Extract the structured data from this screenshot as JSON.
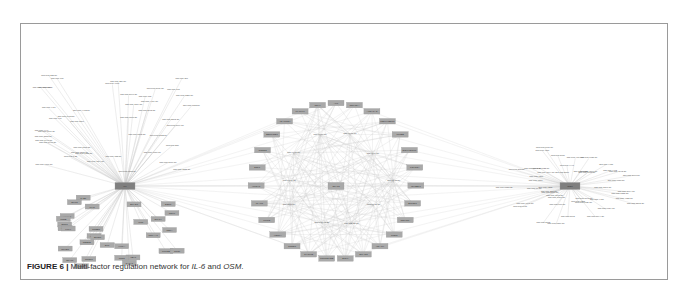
{
  "figure": {
    "label": "FIGURE 6",
    "separator": " | ",
    "caption_prefix": "Multi-factor regulation network for ",
    "gene1": "IL-6",
    "caption_mid": " and ",
    "gene2": "OSM",
    "caption_suffix": "."
  },
  "network": {
    "hubs": [
      {
        "id": "IL6",
        "label": "IL6",
        "x": 125,
        "y": 186
      },
      {
        "id": "STAT3",
        "label": "STAT3",
        "x": 336,
        "y": 186
      },
      {
        "id": "OSM",
        "label": "OSM",
        "x": 570,
        "y": 186
      }
    ],
    "colors": {
      "gene_node": "#a9a9a9",
      "hub_node": "#7f7f7f",
      "edge": "#c8c8c8",
      "mirna_text": "#555555"
    },
    "il6_mirnas": [
      "hsa-miR-23b-5p",
      "hsa-miR-217",
      "hsa-miR-608",
      "hsa-miR-330-5p",
      "hsa-miR-4668",
      "hsa-miR-4518-5p",
      "hsa-miR-1323",
      "hsa-miR-5010-3p",
      "hsa-miR-765",
      "hsa-miR-125b-5p",
      "hsa-miR-5696-5p",
      "hsa-miR-613",
      "hsa-miR-4459-5p",
      "hsa-miR-6852-5p",
      "hsa-miR-6854-5p",
      "hsa-miR-4483-5p",
      "hsa-miR-4434",
      "hsa-miR-3663-5p",
      "hsa-miR-1913-5p",
      "hsa-miR-495",
      "hsa-miR-6508-5p",
      "hsa-miR-3202-3p",
      "hsa-miR-1307",
      "hsa-miR-5004-5p",
      "hsa-miR-6870-5p",
      "hsa-miR-4449",
      "hsa-miR-5722-5p",
      "hsa-miR-6502-3p",
      "hsa-miR-3183-5p",
      "hsa-miR-6740-5p",
      "hsa-miR-1908-5p",
      "hsa-miR-6515-5p",
      "hsa-miR-338",
      "hsa-miR-1285-5p",
      "hsa-miR-6088-5p",
      "hsa-miR-6133-5p",
      "hsa-miR-1-3p",
      "hsa-miR-153-5p",
      "hsa-miR-4504-5p",
      "hsa-miR-3176-5p",
      "hsa-miR-4787-5p",
      "hsa-miR-1322-3p",
      "hsa-miR-6855-5p"
    ],
    "il6_genes": [
      "TAB1",
      "SLIT3",
      "SMAD1",
      "ESR1",
      "MYC",
      "CDK6",
      "FOSL1",
      "JUNB",
      "STAT4",
      "IL6R",
      "EGR1",
      "SOCS3",
      "KLF4",
      "CREB1",
      "RELA",
      "CEBPB",
      "PRKAA1",
      "EP300",
      "CEBPD",
      "HIF1A",
      "SP1",
      "PTGS2",
      "NFKB1",
      "CTCF",
      "YBX1",
      "NR3C1",
      "TP53",
      "STAT1",
      "GATA1",
      "IRF1"
    ],
    "central_genes": [
      "AKT",
      "CDKN1A",
      "ALDH1A2",
      "MELK/TBP11",
      "PLCB2",
      "SOX9/SIRT1",
      "FOXO3A",
      "IGF2BP1",
      "BCL2L1",
      "CDKN2A",
      "PTEN",
      "HDAC4",
      "SMAD3",
      "BCL6",
      "TNFRSF11B",
      "CXCL12",
      "CCND1",
      "VEGFA",
      "MMP2",
      "ICAM1",
      "HMOX1",
      "E2F1",
      "CCND2",
      "SERPINE1",
      "ADAMTS4",
      "MAPK14",
      "CD44"
    ],
    "central_mirnas": [
      "hsa-let-7b-5p",
      "hsa-let-7a-5p",
      "hsa-miR-25-5p",
      "hsa-miR-93-5p",
      "hsa-let-7f-5p",
      "hsa-let-7e-5p",
      "hsa-let-7c-5p",
      "hsa-let-7d-5p",
      "hsa-let-7g-5p",
      "hsa-let-7i-5p"
    ],
    "osm_mirnas": [
      "hsa-miR-1322-3p",
      "hsa-miR-3064-5p",
      "hsa-miR-4632-5p",
      "hsa-miR-3202-3p",
      "hsa-miR-6734-5p",
      "hsa-miR-4428",
      "hsa-miR-5095-3p",
      "hsa-miR-5194-3p",
      "hsa-miR-6820-5p",
      "hsa-miR-1265",
      "hsa-miR-5703",
      "hsa-miR-6510-5p",
      "hsa-miR-876-5p",
      "hsa-miR-3182",
      "hsa-miR-6087-5p",
      "hsa-miR-6811-5p",
      "hsa-miR-1908",
      "hsa-miR-4691-5p",
      "hsa-miR-6876-5p",
      "hsa-miR-373-5p",
      "hsa-miR-4253",
      "hsa-miR-17-5p",
      "hsa-miR-6758-5p",
      "hsa-miR-4518",
      "hsa-miR-372-3p",
      "hsa-miR-4286",
      "hsa-miR-6794-5p",
      "hsa-miR-1343-3p",
      "hsa-miR-6822-5p",
      "hsa-miR-4516",
      "hsa-miR-3157",
      "hsa-miR-6877-5p",
      "hsa-miR-5787",
      "hsa-miR-4447",
      "hsa-miR-4664-5p",
      "hsa-miR-4532",
      "hsa-miR-6731-5p",
      "hsa-miR-6809-5p",
      "hsa-miR-6875-5p",
      "hsa-miR-4455",
      "hsa-miR-4462",
      "hsa-miR-6843-3p",
      "hsa-miR-6856-5p",
      "hsa-miR-3667-5p",
      "hsa-miR-1207-5p"
    ]
  }
}
